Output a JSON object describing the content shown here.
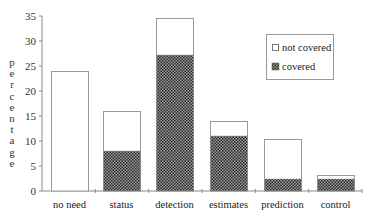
{
  "chart_data": {
    "type": "bar",
    "stacked": true,
    "title": "",
    "xlabel": "",
    "ylabel": "percentage",
    "ylim": [
      0,
      35
    ],
    "yticks": [
      0,
      5,
      10,
      15,
      20,
      25,
      30,
      35
    ],
    "categories": [
      "no need",
      "status",
      "detection",
      "estimates",
      "prediction",
      "control"
    ],
    "series": [
      {
        "name": "covered",
        "values": [
          0,
          8,
          27.2,
          11,
          2.4,
          2.4
        ],
        "fill": "checkered-dark"
      },
      {
        "name": "not covered",
        "values": [
          24,
          8,
          7.4,
          3,
          8,
          0.8
        ],
        "fill": "#ffffff"
      }
    ],
    "totals": [
      24,
      16,
      34.6,
      14,
      10.4,
      3.2
    ],
    "legend": {
      "position": "upper right",
      "entries": [
        "not covered",
        "covered"
      ]
    },
    "grid": false
  },
  "colors": {
    "axis": "#888888",
    "bar_outline": "#999999",
    "covered_dark": "#2b2b2b",
    "covered_light": "#9a9a9a"
  }
}
